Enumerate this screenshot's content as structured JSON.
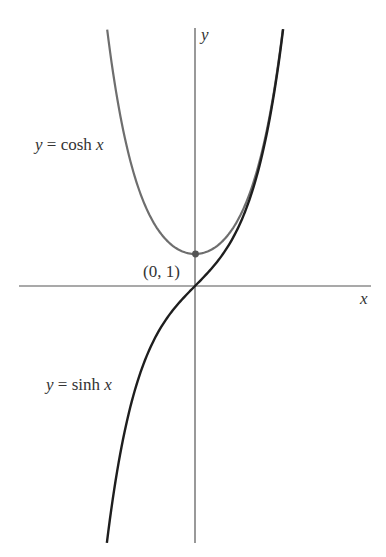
{
  "chart_data": {
    "type": "line",
    "title": "",
    "xlabel": "x",
    "ylabel": "y",
    "xlim": [
      -5.6,
      5.5
    ],
    "ylim": [
      -8.2,
      8.1
    ],
    "grid": false,
    "legend": "none (curve labels placed inline)",
    "series": [
      {
        "name": "y = cosh x",
        "color": "#6e6e6e",
        "x": [
          -2.77,
          -2.5,
          -2.0,
          -1.5,
          -1.0,
          -0.5,
          0.0,
          0.5,
          1.0,
          1.5,
          2.0,
          2.5,
          2.77
        ],
        "y": [
          8.0,
          6.13,
          3.76,
          2.35,
          1.54,
          1.13,
          1.0,
          1.13,
          1.54,
          2.35,
          3.76,
          6.13,
          8.0
        ]
      },
      {
        "name": "y = sinh x",
        "color": "#1e1e1e",
        "x": [
          -2.78,
          -2.5,
          -2.0,
          -1.5,
          -1.0,
          -0.5,
          0.0,
          0.5,
          1.0,
          1.5,
          2.0,
          2.5,
          2.78
        ],
        "y": [
          -8.0,
          -6.05,
          -3.63,
          -2.13,
          -1.18,
          -0.52,
          0.0,
          0.52,
          1.18,
          2.13,
          3.63,
          6.05,
          8.0
        ]
      }
    ],
    "annotations": [
      {
        "text": "(0, 1)",
        "point": [
          0,
          1
        ],
        "marker": "dot"
      }
    ]
  },
  "labels": {
    "x_axis": "x",
    "y_axis": "y",
    "cosh": {
      "var": "y",
      "eq": " = cosh ",
      "arg": "x"
    },
    "sinh": {
      "var": "y",
      "eq": " = sinh ",
      "arg": "x"
    },
    "point": "(0, 1)"
  },
  "colors": {
    "axis": "#555555",
    "cosh": "#6e6e6e",
    "sinh": "#1e1e1e",
    "text": "#333333"
  }
}
